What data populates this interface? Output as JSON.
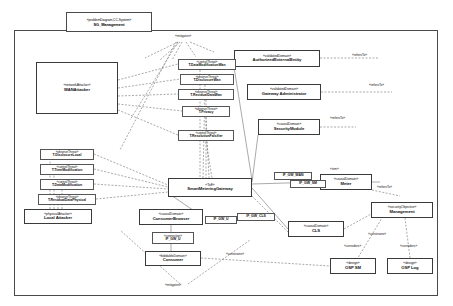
{
  "diagram": {
    "frame_stereotype": "«problemDiagram,CC-System»",
    "frame_title": "SG_Management",
    "title_note": "«mitigates»",
    "bottom_note": "«mitigates»"
  },
  "domains": [
    {
      "id": "wan-attacker",
      "stereotype": "«networkAttacker»",
      "name": "WANAttacker",
      "x": 36,
      "y": 62,
      "w": 82,
      "h": 52
    },
    {
      "id": "authorized-external-entity",
      "stereotype": "«validatedDomain»",
      "name": "AuthorizedExternalEntity",
      "x": 234,
      "y": 50,
      "w": 86,
      "h": 17
    },
    {
      "id": "gateway-administrator",
      "stereotype": "«validatedDomain»",
      "name": "Gateway Administrator",
      "x": 247,
      "y": 84,
      "w": 74,
      "h": 16
    },
    {
      "id": "security-module",
      "stereotype": "«causalDomain»",
      "name": "SecurityModule",
      "x": 258,
      "y": 119,
      "w": 62,
      "h": 16
    },
    {
      "id": "smart-metering-gateway",
      "stereotype": "«ToE»",
      "name": "SmartMeteringGateway",
      "x": 168,
      "y": 178,
      "w": 84,
      "h": 19
    },
    {
      "id": "meter",
      "stereotype": "«causalDomain»",
      "name": "Meter",
      "x": 320,
      "y": 174,
      "w": 52,
      "h": 16
    },
    {
      "id": "management",
      "stereotype": "«securityObjective»",
      "name": "Management",
      "x": 371,
      "y": 202,
      "w": 62,
      "h": 16
    },
    {
      "id": "cls",
      "stereotype": "«causalDomain»",
      "name": "CLS",
      "x": 288,
      "y": 221,
      "w": 56,
      "h": 16
    },
    {
      "id": "consumer-browser",
      "stereotype": "«causalDomain»",
      "name": "ConsumerBrowser",
      "x": 139,
      "y": 209,
      "w": 64,
      "h": 16
    },
    {
      "id": "consumer",
      "stereotype": "«biddableDomain»",
      "name": "Consumer",
      "x": 145,
      "y": 251,
      "w": 56,
      "h": 15
    },
    {
      "id": "local-attacker",
      "stereotype": "«physicalAttacker»",
      "name": "Local Attacker",
      "x": 24,
      "y": 209,
      "w": 68,
      "h": 15
    },
    {
      "id": "osp-sm",
      "stereotype": "«design»",
      "name": "OSP SM",
      "x": 330,
      "y": 258,
      "w": 46,
      "h": 16
    },
    {
      "id": "osp-log",
      "stereotype": "«design»",
      "name": "OSP Log",
      "x": 387,
      "y": 258,
      "w": 46,
      "h": 16
    }
  ],
  "threats_wan": [
    {
      "id": "t-datamod-wan",
      "stereotype": "«controlThreat»",
      "name": "T.DataModificationWan",
      "x": 178,
      "y": 59,
      "w": 58,
      "h": 11
    },
    {
      "id": "t-disclosure-wan",
      "stereotype": "«observeThreat»",
      "name": "T.DisclosureWan",
      "x": 180,
      "y": 74,
      "w": 54,
      "h": 11
    },
    {
      "id": "t-residual-wan",
      "stereotype": "«observeThreat»",
      "name": "T.ResidualDataWan",
      "x": 178,
      "y": 89,
      "w": 56,
      "h": 11
    },
    {
      "id": "t-privacy",
      "stereotype": "«observeThreat»",
      "name": "T.Privacy",
      "x": 182,
      "y": 106,
      "w": 48,
      "h": 11
    },
    {
      "id": "t-timemod-wan",
      "stereotype": "«controlThreat»",
      "name": "T.ResolutionFalsifier",
      "x": 178,
      "y": 130,
      "w": 56,
      "h": 11
    }
  ],
  "threats_local": [
    {
      "id": "t-disclosure-local",
      "stereotype": "«observeThreat»",
      "name": "T.DisclosureLocal",
      "x": 40,
      "y": 149,
      "w": 54,
      "h": 11
    },
    {
      "id": "t-timemodification",
      "stereotype": "«controlThreat»",
      "name": "T.TimeModification",
      "x": 40,
      "y": 164,
      "w": 54,
      "h": 11
    },
    {
      "id": "t-datamodification",
      "stereotype": "«controlThreat»",
      "name": "T.DataModification",
      "x": 40,
      "y": 179,
      "w": 54,
      "h": 11
    },
    {
      "id": "t-residual-physical",
      "stereotype": "«observeThreat»",
      "name": "T.ResidualDataPhysical",
      "x": 38,
      "y": 194,
      "w": 58,
      "h": 11
    }
  ],
  "interfaces": [
    {
      "id": "if-gw-wan",
      "label": "IF_GW_WAN",
      "x": 274,
      "y": 172,
      "w": 38,
      "h": 8
    },
    {
      "id": "if-gw-sm",
      "label": "IF_GW_SM",
      "x": 290,
      "y": 178,
      "w": 36,
      "h": 8
    },
    {
      "id": "if-gw-cls",
      "label": "IF_GW_CLS",
      "x": 237,
      "y": 213,
      "w": 38,
      "h": 8
    },
    {
      "id": "if-gw-u",
      "label": "IF_GW_U",
      "x": 205,
      "y": 216,
      "w": 32,
      "h": 8
    },
    {
      "id": "if-gw-u2",
      "stereotype": "«connection»",
      "label": "IF_GW_U",
      "x": 152,
      "y": 232,
      "w": 42,
      "h": 12
    }
  ],
  "edge_labels": [
    {
      "id": "refers-to-1",
      "text": "«refersTo»",
      "x": 352,
      "y": 54
    },
    {
      "id": "refers-to-2",
      "text": "«refersTo»",
      "x": 369,
      "y": 84
    },
    {
      "id": "refers-to-3",
      "text": "«refersTo»",
      "x": 330,
      "y": 117
    },
    {
      "id": "refers-to-4",
      "text": "«refersTo»",
      "x": 377,
      "y": 186
    },
    {
      "id": "stm",
      "text": "«stm»",
      "x": 330,
      "y": 168
    },
    {
      "id": "constrains-1",
      "text": "«constrains»",
      "x": 226,
      "y": 253
    },
    {
      "id": "constrains-2",
      "text": "«constrains»",
      "x": 368,
      "y": 233
    },
    {
      "id": "considers-1",
      "text": "«considers»",
      "x": 344,
      "y": 245
    },
    {
      "id": "considers-2",
      "text": "«considers»",
      "x": 400,
      "y": 245
    },
    {
      "id": "mitigates-top",
      "text": "«mitigates»",
      "x": 178,
      "y": 37
    },
    {
      "id": "mitigates-bottom",
      "text": "«mitigates»",
      "x": 168,
      "y": 286
    }
  ]
}
